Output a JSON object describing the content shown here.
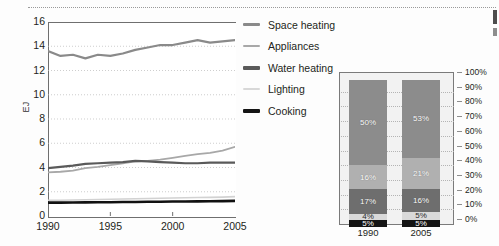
{
  "chart_data": [
    {
      "type": "line",
      "title": "",
      "xlabel": "",
      "ylabel": "EJ",
      "xlim": [
        1990,
        2005
      ],
      "ylim": [
        0,
        16
      ],
      "grid": true,
      "legend_position": "right",
      "x": [
        1990,
        1991,
        1992,
        1993,
        1994,
        1995,
        1996,
        1997,
        1998,
        1999,
        2000,
        2001,
        2002,
        2003,
        2004,
        2005
      ],
      "yticks": [
        "0",
        "2",
        "4",
        "6",
        "8",
        "10",
        "12",
        "14",
        "16"
      ],
      "xticks": [
        "1990",
        "1995",
        "2000",
        "2005"
      ],
      "series": [
        {
          "name": "Space heating",
          "color": "#8a8a8a",
          "width": 2.2,
          "values": [
            13.6,
            13.2,
            13.3,
            13.0,
            13.3,
            13.2,
            13.4,
            13.7,
            13.9,
            14.1,
            14.1,
            14.3,
            14.5,
            14.3,
            14.4,
            14.5
          ]
        },
        {
          "name": "Appliances",
          "color": "#a8a8a8",
          "width": 1.8,
          "values": [
            3.6,
            3.65,
            3.75,
            3.95,
            4.05,
            4.2,
            4.35,
            4.5,
            4.55,
            4.65,
            4.8,
            4.95,
            5.1,
            5.2,
            5.4,
            5.7
          ]
        },
        {
          "name": "Water heating",
          "color": "#5a5a5a",
          "width": 2.2,
          "values": [
            3.95,
            4.05,
            4.15,
            4.3,
            4.35,
            4.4,
            4.45,
            4.55,
            4.5,
            4.45,
            4.4,
            4.35,
            4.35,
            4.4,
            4.4,
            4.4
          ]
        },
        {
          "name": "Lighting",
          "color": "#d2d2d2",
          "width": 1.6,
          "values": [
            1.3,
            1.3,
            1.32,
            1.34,
            1.36,
            1.38,
            1.4,
            1.42,
            1.44,
            1.46,
            1.48,
            1.5,
            1.52,
            1.54,
            1.56,
            1.6
          ]
        },
        {
          "name": "Cooking",
          "color": "#111111",
          "width": 2.6,
          "values": [
            1.1,
            1.1,
            1.11,
            1.12,
            1.13,
            1.14,
            1.15,
            1.16,
            1.17,
            1.18,
            1.19,
            1.2,
            1.21,
            1.22,
            1.23,
            1.25
          ]
        }
      ]
    },
    {
      "type": "bar",
      "stacked": true,
      "title": "",
      "categories": [
        "1990",
        "2005"
      ],
      "ylim": [
        0,
        100
      ],
      "yticks": [
        "0%",
        "10%",
        "20%",
        "30%",
        "40%",
        "50%",
        "60%",
        "70%",
        "80%",
        "90%",
        "100%"
      ],
      "series": [
        {
          "name": "Cooking",
          "color": "#141414",
          "values": [
            5,
            5
          ],
          "labels": [
            "5%",
            "5%"
          ]
        },
        {
          "name": "Lighting",
          "color": "#d9d9d9",
          "values": [
            4,
            5
          ],
          "labels": [
            "4%",
            "5%"
          ]
        },
        {
          "name": "Water heating",
          "color": "#6e6e6e",
          "values": [
            17,
            16
          ],
          "labels": [
            "17%",
            "16%"
          ]
        },
        {
          "name": "Appliances",
          "color": "#b0b0b0",
          "values": [
            16,
            21
          ],
          "labels": [
            "16%",
            "21%"
          ]
        },
        {
          "name": "Space heating",
          "color": "#8c8c8c",
          "values": [
            58,
            53
          ],
          "labels": [
            "50%",
            "53%"
          ]
        }
      ]
    }
  ],
  "line_chart": {
    "y_axis_label": "EJ",
    "y_ticks": [
      "16",
      "14",
      "12",
      "10",
      "8",
      "6",
      "4",
      "2",
      "0"
    ],
    "x_ticks": [
      "1990",
      "1995",
      "2000",
      "2005"
    ]
  },
  "legend": {
    "items": [
      {
        "label": "Space heating",
        "color": "#8a8a8a",
        "thickness": "3px"
      },
      {
        "label": "Appliances",
        "color": "#a8a8a8",
        "thickness": "2px"
      },
      {
        "label": "Water heating",
        "color": "#5a5a5a",
        "thickness": "4px"
      },
      {
        "label": "Lighting",
        "color": "#d8d8d8",
        "thickness": "2px"
      },
      {
        "label": "Cooking",
        "color": "#141414",
        "thickness": "4px"
      }
    ]
  },
  "stacked_chart": {
    "bars": [
      {
        "category": "1990",
        "segments": [
          {
            "name": "Cooking",
            "label": "5%",
            "value": 5,
            "color": "#141414"
          },
          {
            "name": "Lighting",
            "label": "4%",
            "value": 4,
            "color": "#d9d9d9"
          },
          {
            "name": "Water heating",
            "label": "17%",
            "value": 17,
            "color": "#6e6e6e"
          },
          {
            "name": "Appliances",
            "label": "16%",
            "value": 16,
            "color": "#b0b0b0"
          },
          {
            "name": "Space heating",
            "label": "50%",
            "value": 58,
            "color": "#8c8c8c"
          }
        ]
      },
      {
        "category": "2005",
        "segments": [
          {
            "name": "Cooking",
            "label": "5%",
            "value": 5,
            "color": "#141414"
          },
          {
            "name": "Lighting",
            "label": "5%",
            "value": 5,
            "color": "#d9d9d9"
          },
          {
            "name": "Water heating",
            "label": "16%",
            "value": 16,
            "color": "#6e6e6e"
          },
          {
            "name": "Appliances",
            "label": "21%",
            "value": 21,
            "color": "#b0b0b0"
          },
          {
            "name": "Space heating",
            "label": "53%",
            "value": 53,
            "color": "#8c8c8c"
          }
        ]
      }
    ],
    "percent_ticks": [
      "100%",
      "90%",
      "80%",
      "70%",
      "60%",
      "50%",
      "40%",
      "30%",
      "20%",
      "10%",
      "0%"
    ]
  }
}
